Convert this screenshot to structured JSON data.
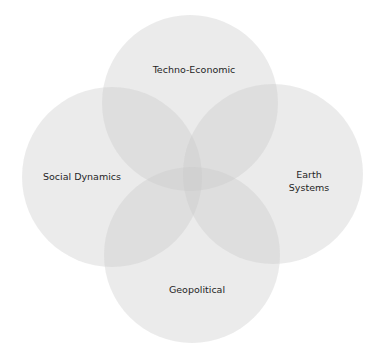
{
  "diagram": {
    "type": "venn",
    "background_color": "#ffffff",
    "circle_fill": "#c8c8c8",
    "label_color": "#1f1f1f",
    "circles": [
      {
        "id": "techno-economic",
        "label": "Techno-Economic",
        "position": "top"
      },
      {
        "id": "social-dynamics",
        "label": "Social Dynamics",
        "position": "left"
      },
      {
        "id": "earth-systems",
        "label_lines": [
          "Earth",
          "Systems"
        ],
        "position": "right"
      },
      {
        "id": "geopolitical",
        "label": "Geopolitical",
        "position": "bottom"
      }
    ]
  }
}
